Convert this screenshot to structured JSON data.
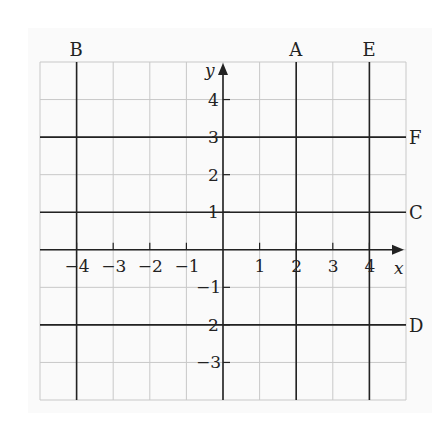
{
  "chart_data": {
    "type": "line",
    "title": "",
    "xlabel": "x",
    "ylabel": "y",
    "xlim": [
      -5,
      5
    ],
    "ylim": [
      -4,
      5
    ],
    "grid": true,
    "x_ticks": [
      -4,
      -3,
      -2,
      -1,
      1,
      2,
      3,
      4
    ],
    "x_tick_labels": [
      "−4",
      "−3",
      "−2",
      "−1",
      "1",
      "2",
      "3",
      "4"
    ],
    "y_ticks": [
      4,
      3,
      2,
      1,
      -1,
      -2,
      -3
    ],
    "y_tick_labels": [
      "4",
      "3",
      "2",
      "1",
      "−1",
      "2",
      "−3"
    ],
    "lines": [
      {
        "label": "A",
        "orientation": "vertical",
        "equation": "x = 2",
        "value": 2
      },
      {
        "label": "B",
        "orientation": "vertical",
        "equation": "x = -4",
        "value": -4
      },
      {
        "label": "E",
        "orientation": "vertical",
        "equation": "x = 4",
        "value": 4
      },
      {
        "label": "F",
        "orientation": "horizontal",
        "equation": "y = 3",
        "value": 3
      },
      {
        "label": "C",
        "orientation": "horizontal",
        "equation": "y = 1",
        "value": 1
      },
      {
        "label": "D",
        "orientation": "horizontal",
        "equation": "y = -2",
        "value": -2
      }
    ]
  },
  "colors": {
    "grid": "#c8c8c8",
    "line": "#222222",
    "background": "#fafafa"
  }
}
